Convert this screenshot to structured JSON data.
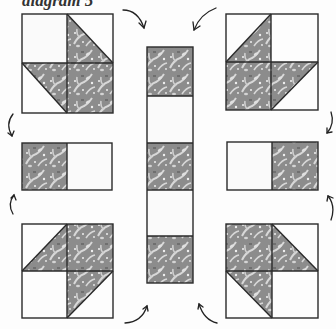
{
  "caption": "diagram 5",
  "colors": {
    "fabric_base": "#8c8c8c",
    "fabric_pattern": "#dcdcdc",
    "background_square": "#fafafa",
    "outline": "#2a2a2a"
  },
  "blocks": [
    {
      "name": "block-top-left",
      "type": "pinwheel-2x2",
      "cells": [
        "white",
        "half-tl-br-lower-left-dark",
        "half-tl-br-upper-right-dark",
        "dark"
      ]
    },
    {
      "name": "block-top-right",
      "type": "pinwheel-2x2",
      "cells": [
        "half-bl-tr-lower-right-dark",
        "white",
        "dark",
        "half-bl-tr-upper-left-dark"
      ]
    },
    {
      "name": "block-middle-left",
      "type": "strip-1x2",
      "cells": [
        "dark",
        "white"
      ]
    },
    {
      "name": "block-middle-right",
      "type": "strip-1x2",
      "cells": [
        "white",
        "dark"
      ]
    },
    {
      "name": "block-bottom-left",
      "type": "pinwheel-2x2",
      "cells": [
        "half-bl-tr-lower-right-dark",
        "dark",
        "white",
        "half-bl-tr-upper-left-dark"
      ]
    },
    {
      "name": "block-bottom-right",
      "type": "pinwheel-2x2",
      "cells": [
        "dark",
        "half-tl-br-lower-left-dark",
        "half-tl-br-upper-right-dark",
        "white"
      ]
    },
    {
      "name": "center-column",
      "type": "strip-5x1",
      "cells": [
        "dark",
        "white",
        "dark",
        "white",
        "dark"
      ]
    }
  ],
  "arrows": [
    {
      "name": "arrow-top-left-to-center",
      "direction": "curving-down-right"
    },
    {
      "name": "arrow-top-right-to-center",
      "direction": "curving-down-left"
    },
    {
      "name": "arrow-left-upper",
      "direction": "curving-down"
    },
    {
      "name": "arrow-left-lower",
      "direction": "curving-up"
    },
    {
      "name": "arrow-right-upper",
      "direction": "curving-down"
    },
    {
      "name": "arrow-right-lower",
      "direction": "curving-up"
    },
    {
      "name": "arrow-bottom-left-to-center",
      "direction": "curving-up-right"
    },
    {
      "name": "arrow-bottom-right-to-center",
      "direction": "curving-up-left"
    }
  ]
}
